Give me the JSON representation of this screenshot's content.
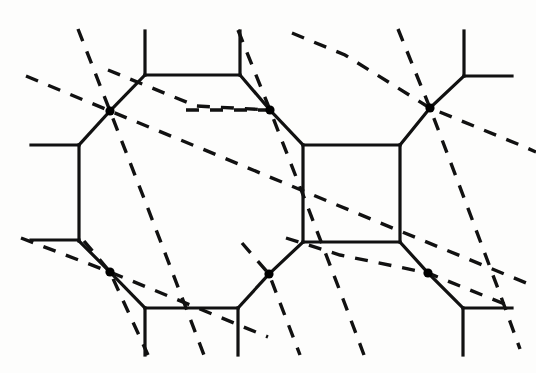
{
  "figure": {
    "canvas": {
      "width": 536,
      "height": 373
    },
    "colors": {
      "background": "#fdfdfc",
      "solid_line": "#111111",
      "dashed_line": "#111111",
      "vertex": "#000000"
    },
    "style": {
      "solid_stroke_width": 3.2,
      "dashed_stroke_width": 3.4,
      "dash_pattern": "13 11",
      "vertex_radius": 4.6
    }
  },
  "chart_data": {
    "type": "diagram",
    "solid_polylines": [
      {
        "name": "octagon-top-left-upper-stub",
        "points": [
          [
            145,
            31
          ],
          [
            145,
            75
          ]
        ]
      },
      {
        "name": "octagon-top-edge",
        "points": [
          [
            145,
            75
          ],
          [
            240,
            75
          ]
        ]
      },
      {
        "name": "octagon-top-right-upper-stub",
        "points": [
          [
            240,
            31
          ],
          [
            240,
            75
          ]
        ]
      },
      {
        "name": "octagon-upper-left-diagonal",
        "points": [
          [
            145,
            75
          ],
          [
            110,
            111
          ]
        ]
      },
      {
        "name": "octagon-upper-right-diagonal",
        "points": [
          [
            240,
            75
          ],
          [
            270,
            110
          ]
        ]
      },
      {
        "name": "octagon-left-upper-diagonal",
        "points": [
          [
            110,
            111
          ],
          [
            79,
            145
          ]
        ]
      },
      {
        "name": "octagon-left-edge",
        "points": [
          [
            79,
            145
          ],
          [
            79,
            241
          ]
        ]
      },
      {
        "name": "octagon-left-upper-stub",
        "points": [
          [
            31,
            145
          ],
          [
            79,
            145
          ]
        ]
      },
      {
        "name": "octagon-left-lower-stub",
        "points": [
          [
            31,
            240
          ],
          [
            79,
            240
          ]
        ]
      },
      {
        "name": "octagon-left-lower-diagonal",
        "points": [
          [
            79,
            241
          ],
          [
            110,
            272
          ]
        ]
      },
      {
        "name": "octagon-lower-left-diagonal",
        "points": [
          [
            110,
            272
          ],
          [
            145,
            308
          ]
        ]
      },
      {
        "name": "octagon-bottom-edge",
        "points": [
          [
            145,
            308
          ],
          [
            238,
            308
          ]
        ]
      },
      {
        "name": "octagon-bottom-left-lower-stub",
        "points": [
          [
            145,
            308
          ],
          [
            145,
            355
          ]
        ]
      },
      {
        "name": "octagon-bottom-right-lower-stub",
        "points": [
          [
            238,
            308
          ],
          [
            238,
            355
          ]
        ]
      },
      {
        "name": "octagon-lower-right-diagonal",
        "points": [
          [
            238,
            308
          ],
          [
            269,
            274
          ]
        ]
      },
      {
        "name": "square-upper-left-diagonal",
        "points": [
          [
            270,
            110
          ],
          [
            303,
            145
          ]
        ]
      },
      {
        "name": "square-top-edge",
        "points": [
          [
            303,
            145
          ],
          [
            400,
            145
          ]
        ]
      },
      {
        "name": "square-left-edge",
        "points": [
          [
            303,
            145
          ],
          [
            303,
            242
          ]
        ]
      },
      {
        "name": "square-right-edge",
        "points": [
          [
            400,
            145
          ],
          [
            400,
            242
          ]
        ]
      },
      {
        "name": "square-bottom-edge",
        "points": [
          [
            303,
            242
          ],
          [
            400,
            242
          ]
        ]
      },
      {
        "name": "square-lower-left-diagonal",
        "points": [
          [
            303,
            242
          ],
          [
            269,
            274
          ]
        ]
      },
      {
        "name": "square-upper-right-diagonal",
        "points": [
          [
            400,
            145
          ],
          [
            430,
            108
          ]
        ]
      },
      {
        "name": "square-lower-right-diagonal",
        "points": [
          [
            400,
            242
          ],
          [
            428,
            273
          ]
        ]
      },
      {
        "name": "right-upper-diagonal",
        "points": [
          [
            430,
            108
          ],
          [
            464,
            76
          ]
        ]
      },
      {
        "name": "right-upper-vertical-stub",
        "points": [
          [
            464,
            31
          ],
          [
            464,
            76
          ]
        ]
      },
      {
        "name": "right-upper-horizontal-stub",
        "points": [
          [
            464,
            76
          ],
          [
            512,
            76
          ]
        ]
      },
      {
        "name": "right-lower-diagonal",
        "points": [
          [
            428,
            273
          ],
          [
            463,
            308
          ]
        ]
      },
      {
        "name": "right-lower-horizontal-stub",
        "points": [
          [
            463,
            308
          ],
          [
            512,
            308
          ]
        ]
      },
      {
        "name": "right-lower-vertical-stub",
        "points": [
          [
            463,
            308
          ],
          [
            463,
            355
          ]
        ]
      }
    ],
    "dashed_polylines": [
      {
        "name": "dashed-a1",
        "points": [
          [
            26,
            76
          ],
          [
            110,
            111
          ],
          [
            200,
            148
          ],
          [
            289,
            185
          ],
          [
            378,
            222
          ],
          [
            468,
            259
          ],
          [
            536,
            287
          ]
        ]
      },
      {
        "name": "dashed-a2",
        "points": [
          [
            21,
            238
          ],
          [
            110,
            272
          ],
          [
            200,
            309
          ],
          [
            268,
            337
          ]
        ]
      },
      {
        "name": "dashed-a3",
        "points": [
          [
            186,
            110
          ],
          [
            270,
            110
          ]
        ]
      },
      {
        "name": "dashed-a4",
        "points": [
          [
            108,
            70
          ],
          [
            196,
            106
          ],
          [
            270,
            110
          ]
        ]
      },
      {
        "name": "dashed-a5",
        "points": [
          [
            292,
            33
          ],
          [
            345,
            55
          ],
          [
            430,
            108
          ],
          [
            520,
            145
          ],
          [
            536,
            152
          ]
        ]
      },
      {
        "name": "dashed-a6",
        "points": [
          [
            286,
            238
          ],
          [
            340,
            255
          ],
          [
            428,
            273
          ],
          [
            512,
            307
          ]
        ]
      },
      {
        "name": "dashed-b1",
        "points": [
          [
            78,
            29
          ],
          [
            110,
            111
          ],
          [
            147,
            206
          ],
          [
            183,
            300
          ],
          [
            204,
            355
          ]
        ]
      },
      {
        "name": "dashed-b2",
        "points": [
          [
            238,
            30
          ],
          [
            270,
            110
          ],
          [
            307,
            205
          ],
          [
            343,
            299
          ],
          [
            364,
            355
          ]
        ]
      },
      {
        "name": "dashed-b3",
        "points": [
          [
            398,
            29
          ],
          [
            430,
            108
          ],
          [
            466,
            203
          ],
          [
            500,
            294
          ],
          [
            520,
            349
          ]
        ]
      },
      {
        "name": "dashed-b4",
        "points": [
          [
            84,
            241
          ],
          [
            110,
            272
          ],
          [
            148,
            355
          ]
        ]
      },
      {
        "name": "dashed-b5",
        "points": [
          [
            242,
            243
          ],
          [
            269,
            274
          ],
          [
            300,
            355
          ]
        ]
      }
    ],
    "vertices": [
      {
        "name": "vertex-top-left",
        "x": 110,
        "y": 111
      },
      {
        "name": "vertex-top-center",
        "x": 270,
        "y": 110
      },
      {
        "name": "vertex-top-right",
        "x": 430,
        "y": 108
      },
      {
        "name": "vertex-bottom-left",
        "x": 110,
        "y": 272
      },
      {
        "name": "vertex-bottom-center",
        "x": 269,
        "y": 274
      },
      {
        "name": "vertex-bottom-right",
        "x": 428,
        "y": 273
      }
    ]
  }
}
